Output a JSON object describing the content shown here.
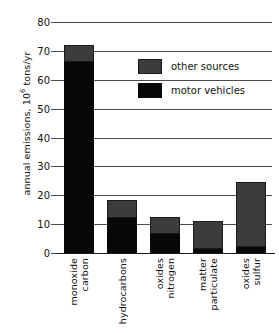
{
  "chart_data": {
    "type": "bar",
    "stacked": true,
    "title": "",
    "xlabel": "",
    "ylabel": "annual emissions, 10^6 tons/yr",
    "ylabel_prefix": "annual emissions, 10",
    "ylabel_exponent": "6",
    "ylabel_suffix": " tons/yr",
    "ylim": [
      0,
      80
    ],
    "ytick_labels": [
      "0",
      "10",
      "20",
      "30",
      "40",
      "50",
      "60",
      "70",
      "80"
    ],
    "yticks": [
      0,
      10,
      20,
      30,
      40,
      50,
      60,
      70,
      80
    ],
    "grid": true,
    "grid_axis": "y",
    "legend_position": "upper right",
    "categories": [
      "carbon monoxide",
      "hydrocarbons",
      "nitrogen oxides",
      "particulate matter",
      "sulfur oxides"
    ],
    "category_lines": [
      [
        "carbon",
        "monoxide"
      ],
      [
        "hydrocarbons"
      ],
      [
        "nitrogen",
        "oxides"
      ],
      [
        "particulate",
        "matter"
      ],
      [
        "sulfur",
        "oxides"
      ]
    ],
    "series": [
      {
        "name": "motor vehicles",
        "color": "#080808",
        "values": [
          66,
          12,
          6.5,
          1.5,
          2
        ]
      },
      {
        "name": "other sources",
        "color": "#3c3c3c",
        "values": [
          6,
          6.5,
          6,
          9.5,
          22.5
        ]
      }
    ],
    "totals": [
      72,
      18.5,
      12.5,
      11,
      24.5
    ]
  },
  "legend": {
    "items": [
      {
        "label": "other sources",
        "swatch": "other",
        "color": "#3c3c3c"
      },
      {
        "label": "motor vehicles",
        "swatch": "motor",
        "color": "#080808"
      }
    ]
  }
}
